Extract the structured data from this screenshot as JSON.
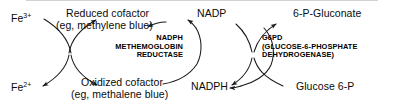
{
  "diagram": {
    "type": "cycle-diagram",
    "colors": {
      "stroke": "#1a1a1a",
      "text": "#0b0b0b",
      "background": "#ffffff",
      "top_rule": "#d2d2d2"
    },
    "ions": {
      "ferric": "Fe",
      "ferric_charge": "3+",
      "ferrous": "Fe",
      "ferrous_charge": "2+"
    },
    "cofactor": {
      "reduced_line1": "Reduced cofactor",
      "reduced_line2": "(eg, methylene blue)",
      "oxidized_line1": "Oxidized cofactor",
      "oxidized_line2": "(eg, methalene blue)"
    },
    "nucleotides": {
      "oxidized": "NADP",
      "reduced": "NADPH"
    },
    "sugars": {
      "product": "6-P-Gluconate",
      "substrate": "Glucose 6-P"
    },
    "enzymes": {
      "left": {
        "line1": "NADPH",
        "line2": "METHEMOGLOBIN",
        "line3": "REDUCTASE"
      },
      "right": {
        "line1": "G6PD",
        "line2": "(GLUCOSE-6-PHOSPHATE",
        "line3": "DEHYDROGENASE)"
      }
    }
  }
}
